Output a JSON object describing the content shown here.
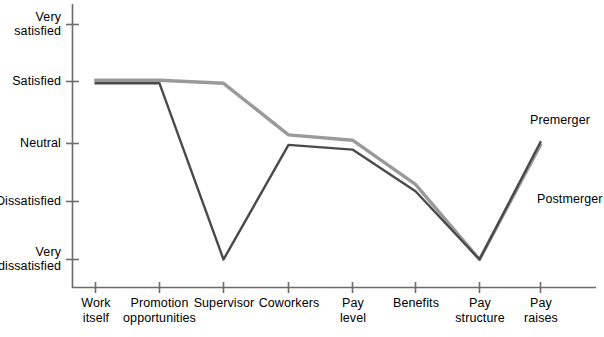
{
  "chart_data": {
    "type": "line",
    "title": "",
    "subtitle": "",
    "xlabel": "",
    "ylabel": "",
    "grid": false,
    "legend_position": "inline-right",
    "categories": [
      "Work\nitself",
      "Promotion\nopportunities",
      "Supervisor",
      "Coworkers",
      "Pay\nlevel",
      "Benefits",
      "Pay\nstructure",
      "Pay\nraises"
    ],
    "y_tick_labels": [
      "Very\nsatisfied",
      "Satisfied",
      "Neutral",
      "Dissatisfied",
      "Very\ndissatisfied"
    ],
    "y_tick_values": [
      5,
      4,
      3,
      2,
      1
    ],
    "ylim": [
      1,
      5
    ],
    "series": [
      {
        "name": "Premerger",
        "color": "#9a9a9a",
        "values": [
          4.05,
          4.05,
          4.0,
          3.12,
          3.03,
          2.28,
          1.0,
          2.95
        ]
      },
      {
        "name": "Postmerger",
        "color": "#4a4a4a",
        "values": [
          4.0,
          4.0,
          1.0,
          2.95,
          2.87,
          2.16,
          1.0,
          3.0
        ]
      }
    ],
    "annotations": [
      {
        "text": "Premerger",
        "series": "Premerger"
      },
      {
        "text": "Postmerger",
        "series": "Postmerger"
      }
    ]
  },
  "axes": {
    "axis_color": "#6b6b6b",
    "tick_color": "#6b6b6b"
  }
}
